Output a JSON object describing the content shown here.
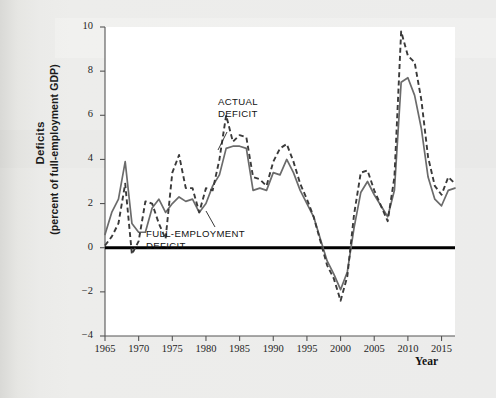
{
  "figure": {
    "y_axis_title_main": "Deficits",
    "y_axis_title_sub": "(percent of full-employment GDP)",
    "x_axis_title": "Year",
    "annotation_actual_line1": "ACTUAL",
    "annotation_actual_line2": "DEFICIT",
    "annotation_full_line1": "FULL-EMPLOYMENT",
    "annotation_full_line2": "DEFICIT"
  },
  "colors": {
    "actual_deficit": "#3a3a3a",
    "full_employment_deficit": "#6b6b6b",
    "zero_line": "#000000",
    "axis": "#555555",
    "plot_background": "#ffffff",
    "page_background": "#ebebe9"
  },
  "chart_data": {
    "type": "line",
    "title": "",
    "xlabel": "Year",
    "ylabel": "Deficits (percent of full-employment GDP)",
    "xlim": [
      1965,
      2017
    ],
    "ylim": [
      -4,
      10
    ],
    "xticks": [
      1965,
      1970,
      1975,
      1980,
      1985,
      1990,
      1995,
      2000,
      2005,
      2010,
      2015
    ],
    "yticks": [
      -4,
      -2,
      0,
      2,
      4,
      6,
      8,
      10
    ],
    "grid": false,
    "legend_position": "inline-annotations",
    "zero_reference_line": 0,
    "x": [
      1965,
      1966,
      1967,
      1968,
      1969,
      1970,
      1971,
      1972,
      1973,
      1974,
      1975,
      1976,
      1977,
      1978,
      1979,
      1980,
      1981,
      1982,
      1983,
      1984,
      1985,
      1986,
      1987,
      1988,
      1989,
      1990,
      1991,
      1992,
      1993,
      1994,
      1995,
      1996,
      1997,
      1998,
      1999,
      2000,
      2001,
      2002,
      2003,
      2004,
      2005,
      2006,
      2007,
      2008,
      2009,
      2010,
      2011,
      2012,
      2013,
      2014,
      2015,
      2016,
      2017
    ],
    "series": [
      {
        "name": "ACTUAL DEFICIT",
        "style": "dashed",
        "color": "#3a3a3a",
        "values": [
          0.1,
          0.5,
          1.1,
          2.9,
          -0.3,
          0.3,
          2.1,
          2.0,
          1.1,
          0.4,
          3.4,
          4.2,
          2.7,
          2.7,
          1.6,
          2.7,
          2.6,
          4.0,
          6.0,
          4.8,
          5.1,
          5.0,
          3.2,
          3.1,
          2.8,
          3.9,
          4.5,
          4.7,
          3.9,
          2.9,
          2.2,
          1.4,
          0.3,
          -0.8,
          -1.4,
          -2.4,
          -1.3,
          1.5,
          3.4,
          3.5,
          2.6,
          1.9,
          1.2,
          3.2,
          9.8,
          8.7,
          8.4,
          6.7,
          4.1,
          2.8,
          2.4,
          3.2,
          2.9
        ]
      },
      {
        "name": "FULL-EMPLOYMENT DEFICIT",
        "style": "solid",
        "color": "#6b6b6b",
        "values": [
          0.6,
          1.6,
          2.2,
          3.9,
          1.1,
          0.7,
          0.7,
          1.8,
          2.2,
          1.6,
          2.0,
          2.3,
          2.1,
          2.2,
          1.6,
          2.0,
          2.8,
          3.3,
          4.5,
          4.6,
          4.6,
          4.5,
          2.6,
          2.7,
          2.6,
          3.4,
          3.3,
          4.0,
          3.4,
          2.6,
          2.0,
          1.4,
          0.4,
          -0.6,
          -1.2,
          -1.9,
          -1.1,
          0.9,
          2.5,
          3.0,
          2.4,
          1.9,
          1.4,
          2.6,
          7.5,
          7.7,
          6.9,
          5.4,
          3.2,
          2.2,
          1.9,
          2.6,
          2.7
        ]
      }
    ]
  }
}
